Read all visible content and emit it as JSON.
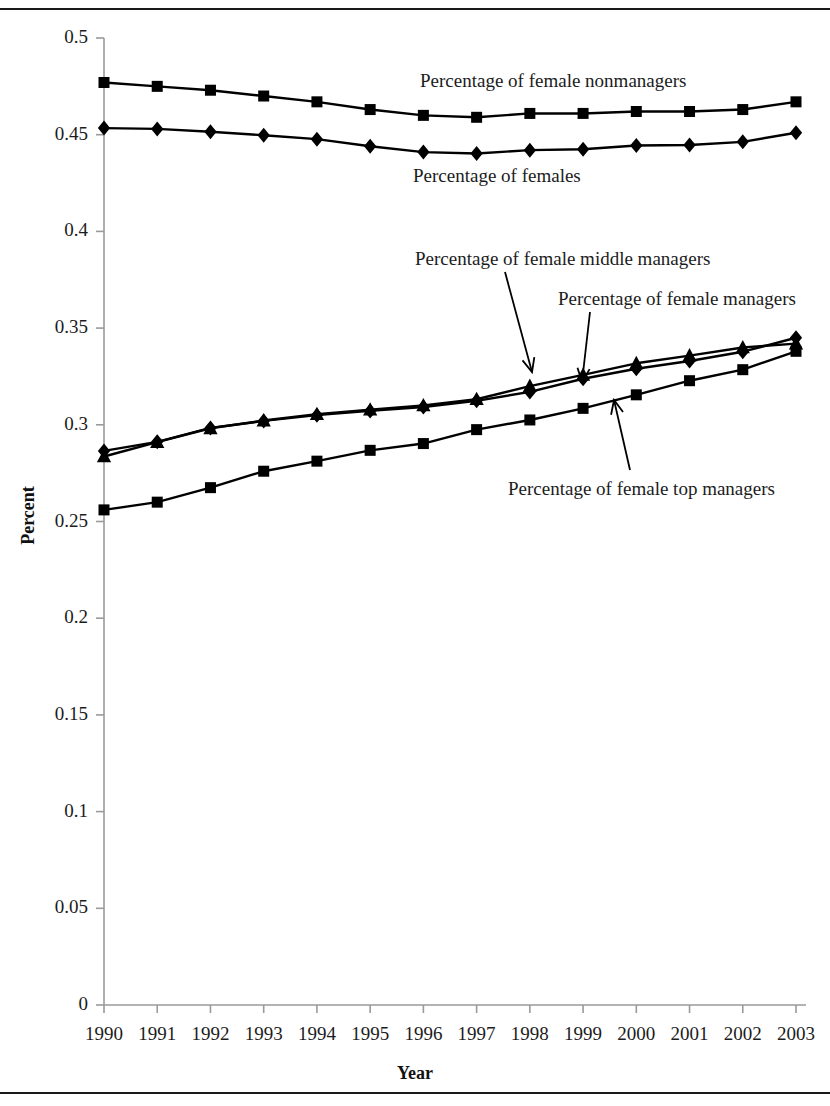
{
  "figure": {
    "y_axis_title": "Percent",
    "x_axis_title": "Year"
  },
  "chart_data": {
    "type": "line",
    "title": "",
    "xlabel": "Year",
    "ylabel": "Percent",
    "xlim": [
      1990,
      2003
    ],
    "ylim": [
      0,
      0.5
    ],
    "grid": false,
    "legend": "inline-annotations",
    "x": [
      1990,
      1991,
      1992,
      1993,
      1994,
      1995,
      1996,
      1997,
      1998,
      1999,
      2000,
      2001,
      2002,
      2003
    ],
    "xticklabels": [
      "1990",
      "1991",
      "1992",
      "1993",
      "1994",
      "1995",
      "1996",
      "1997",
      "1998",
      "1999",
      "2000",
      "2001",
      "2002",
      "2003"
    ],
    "yticks": [
      0,
      0.05,
      0.1,
      0.15,
      0.2,
      0.25,
      0.3,
      0.35,
      0.4,
      0.45,
      0.5
    ],
    "yticklabels": [
      "0",
      "0.05",
      "0.1",
      "0.15",
      "0.2",
      "0.25",
      "0.3",
      "0.35",
      "0.4",
      "0.45",
      "0.5"
    ],
    "series": [
      {
        "name": "Percentage of female nonmanagers",
        "marker": "square",
        "color": "#000000",
        "values": [
          0.477,
          0.475,
          0.473,
          0.47,
          0.467,
          0.463,
          0.46,
          0.459,
          0.461,
          0.461,
          0.462,
          0.462,
          0.463,
          0.467
        ]
      },
      {
        "name": "Percentage of females",
        "marker": "diamond",
        "color": "#000000",
        "values": [
          0.4534,
          0.453,
          0.4515,
          0.4497,
          0.4477,
          0.444,
          0.441,
          0.4403,
          0.442,
          0.4425,
          0.4444,
          0.4447,
          0.4463,
          0.451
        ]
      },
      {
        "name": "Percentage of female managers",
        "marker": "diamond",
        "color": "#000000",
        "values": [
          0.2865,
          0.2912,
          0.2984,
          0.302,
          0.305,
          0.3072,
          0.3092,
          0.3124,
          0.317,
          0.3238,
          0.329,
          0.333,
          0.3378,
          0.345
        ]
      },
      {
        "name": "Percentage of female middle managers",
        "marker": "triangle",
        "color": "#000000",
        "values": [
          0.2836,
          0.291,
          0.2982,
          0.3022,
          0.3055,
          0.3078,
          0.31,
          0.3132,
          0.32,
          0.3258,
          0.3318,
          0.3358,
          0.34,
          0.342
        ]
      },
      {
        "name": "Percentage of female top managers",
        "marker": "square",
        "color": "#000000",
        "values": [
          0.256,
          0.26,
          0.2675,
          0.276,
          0.2812,
          0.2868,
          0.2903,
          0.2975,
          0.3025,
          0.3085,
          0.3155,
          0.3228,
          0.3285,
          0.338
        ]
      }
    ],
    "annotations": [
      {
        "name": "annotation-nonmanagers",
        "text": "Percentage of female nonmanagers",
        "label_x": 420,
        "label_y": 70,
        "arrow": false
      },
      {
        "name": "annotation-females",
        "text": "Percentage of females",
        "label_x": 413,
        "label_y": 165,
        "arrow": false
      },
      {
        "name": "annotation-middle-managers",
        "text": "Percentage of female middle managers",
        "label_x": 415,
        "label_y": 248,
        "arrow": true,
        "arrow_from": [
          505,
          272
        ],
        "arrow_to": [
          532,
          372
        ]
      },
      {
        "name": "annotation-managers",
        "text": "Percentage of female managers",
        "label_x": 558,
        "label_y": 288,
        "arrow": true,
        "arrow_from": [
          590,
          312
        ],
        "arrow_to": [
          582,
          382
        ]
      },
      {
        "name": "annotation-top-managers",
        "text": "Percentage of female top managers",
        "label_x": 508,
        "label_y": 478,
        "arrow": true,
        "arrow_from": [
          630,
          470
        ],
        "arrow_to": [
          614,
          400
        ]
      }
    ]
  }
}
